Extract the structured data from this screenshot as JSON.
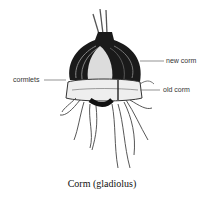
{
  "figure": {
    "caption": "Corm (gladiolus)",
    "labels": {
      "new_corm": "new corm",
      "old_corm": "old corm",
      "cormlets": "cormlets"
    }
  }
}
